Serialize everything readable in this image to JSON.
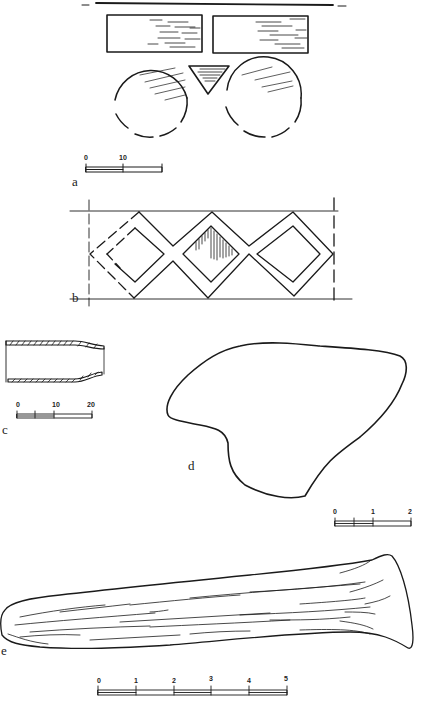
{
  "figure": {
    "panels": [
      {
        "id": "a",
        "label": "a",
        "description": "rectangular plates, triangular inlay and circular discs",
        "scale": {
          "ticks": [
            "0",
            "10"
          ]
        }
      },
      {
        "id": "b",
        "label": "b",
        "description": "band with lozenge (diamond) pattern"
      },
      {
        "id": "c",
        "label": "c",
        "description": "tubular object, section",
        "scale": {
          "ticks": [
            "0",
            "10",
            "20"
          ]
        }
      },
      {
        "id": "d",
        "label": "d",
        "description": "irregular flat object, outline",
        "scale": {
          "ticks": [
            "0",
            "1",
            "2"
          ]
        }
      },
      {
        "id": "e",
        "label": "e",
        "description": "elongated bone/antler tool",
        "scale": {
          "ticks": [
            "0",
            "1",
            "2",
            "3",
            "4",
            "5"
          ]
        }
      }
    ]
  },
  "colors": {
    "ink": "#1a1a1a",
    "paper": "#ffffff"
  }
}
